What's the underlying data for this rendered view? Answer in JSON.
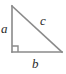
{
  "figure": {
    "name": "right-triangle-labeled-sides",
    "background_color": "#ffffff",
    "stroke_color": "#8a8a8a",
    "label_color": "#2b2b2b",
    "stroke_width": 1.6
  },
  "labels": {
    "leg_vertical": "a",
    "leg_horizontal": "b",
    "hypotenuse": "c"
  },
  "geometry": {
    "apex": {
      "x": 12,
      "y": 6
    },
    "right_angle_vertex": {
      "x": 12,
      "y": 52
    },
    "right_vertex": {
      "x": 62,
      "y": 52
    },
    "right_angle_marker_size": 6
  }
}
